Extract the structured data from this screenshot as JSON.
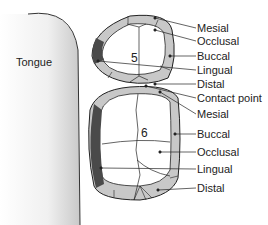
{
  "tongue_label": "Tongue",
  "tooth5": {
    "number": "5",
    "labels": [
      "Mesial",
      "Occlusal",
      "Buccal",
      "Lingual",
      "Distal"
    ]
  },
  "contact_point_label": "Contact point",
  "tooth6": {
    "number": "6",
    "labels": [
      "Mesial",
      "Buccal",
      "Occlusal",
      "Lingual",
      "Distal"
    ]
  },
  "colors": {
    "surface_light": "#c8c8c8",
    "lingual_dark": "#4a4a4a",
    "outline": "#222222",
    "tongue_shade": "#d8d8d8"
  }
}
